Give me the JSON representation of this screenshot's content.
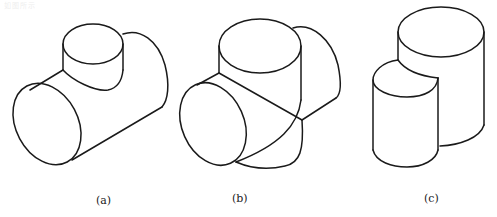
{
  "figure": {
    "top_fragment": "如图所示",
    "panels": [
      {
        "id": "a",
        "caption": "(a)",
        "description": "Horizontal cylinder with a smaller vertical cylinder intersecting on top (T-junction)"
      },
      {
        "id": "b",
        "caption": "(b)",
        "description": "Two equal-diameter cylinders intersecting at right angles (cross junction)"
      },
      {
        "id": "c",
        "caption": "(c)",
        "description": "Two parallel vertical cylinders of different sizes joined side by side"
      }
    ],
    "line_color": "#1a1a1a",
    "background": "#ffffff"
  }
}
